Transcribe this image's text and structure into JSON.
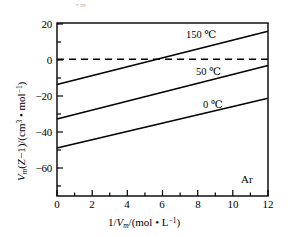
{
  "chart_data": {
    "type": "line",
    "title": "",
    "xlabel": "1/Vm/(mol · L^-1)",
    "ylabel": "Vm(Z-1)/(cm^3 · mol^-1)",
    "xlim": [
      0,
      12
    ],
    "ylim": [
      -75.5,
      20
    ],
    "xticks": [
      0,
      2,
      4,
      6,
      8,
      10,
      12
    ],
    "yticks": [
      20,
      0,
      -20,
      -40,
      -60
    ],
    "grid": false,
    "legend_position": "inline-right",
    "annotations": [
      {
        "name": "gas-species",
        "text": "Ar",
        "x": 11.1,
        "y": -63.5
      }
    ],
    "reference_lines": [
      {
        "name": "zero-line",
        "orientation": "horizontal",
        "value": 0,
        "style": "dashed"
      }
    ],
    "series": [
      {
        "name": "150 ℃",
        "label": "150 ℃",
        "style": "solid",
        "x": [
          0,
          12
        ],
        "values": [
          -14.0,
          15.5
        ],
        "label_x": 7.4,
        "label_y": 13.0
      },
      {
        "name": "50 ℃",
        "label": "50 ℃",
        "style": "solid",
        "x": [
          0,
          12
        ],
        "values": [
          -33.0,
          -3.5
        ],
        "label_x": 7.9,
        "label_y": -4.0
      },
      {
        "name": "0 ℃",
        "label": "0 ℃",
        "style": "solid",
        "x": [
          0,
          12
        ],
        "values": [
          -49.0,
          -21.5
        ],
        "label_x": 8.4,
        "label_y": -22.5
      }
    ]
  },
  "axes": {
    "x_tick_labels": [
      "0",
      "2",
      "4",
      "6",
      "8",
      "10",
      "12"
    ],
    "y_tick_labels": [
      "20",
      "0",
      "−20",
      "−40",
      "−60"
    ],
    "x_axis_title_parts": {
      "prefix": "1/",
      "var": "V",
      "sub": "m",
      "unit": "/(mol • L",
      "exp": "−1",
      "suffix": ")"
    },
    "y_axis_title_parts": {
      "var": "V",
      "sub": "m",
      "open": "(",
      "z": "Z",
      "minus_one": "−1)/(cm",
      "exp3": "3",
      "middle": " • mol",
      "exp_m1": "−1",
      "close": ")"
    }
  },
  "labels": {
    "gas": "Ar",
    "series_150": "150 ℃",
    "series_50": "50 ℃",
    "series_0": "0 ℃"
  },
  "top_artifact": {
    "text": "• m"
  },
  "colors": {
    "background": "#ffffff",
    "axis": "#000000",
    "line": "#000000",
    "dashed": "#000000",
    "text": "#000000"
  }
}
